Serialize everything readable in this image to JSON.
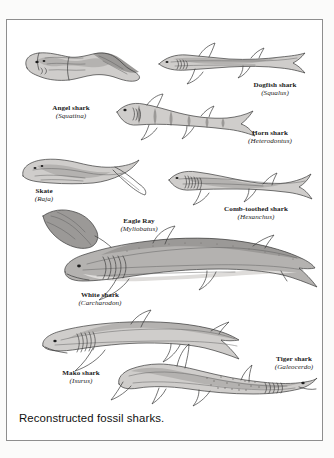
{
  "figure": {
    "caption": "Reconstructed fossil sharks.",
    "specimens": [
      {
        "id": "angel-shark",
        "common_name": "Angel shark",
        "genus": "(Squatina)"
      },
      {
        "id": "dogfish-shark",
        "common_name": "Dogfish shark",
        "genus": "(Squalus)"
      },
      {
        "id": "horn-shark",
        "common_name": "Horn shark",
        "genus": "(Heterodontus)"
      },
      {
        "id": "skate",
        "common_name": "Skate",
        "genus": "(Raja)"
      },
      {
        "id": "eagle-ray",
        "common_name": "Eagle Ray",
        "genus": "(Myliobatus)"
      },
      {
        "id": "comb-toothed-shark",
        "common_name": "Comb-toothed shark",
        "genus": "(Hexanchus)"
      },
      {
        "id": "white-shark",
        "common_name": "White shark",
        "genus": "(Carcharodon)"
      },
      {
        "id": "mako-shark",
        "common_name": "Mako shark",
        "genus": "(Isurus)"
      },
      {
        "id": "tiger-shark",
        "common_name": "Tiger shark",
        "genus": "(Galeocerdo)"
      }
    ],
    "colors": {
      "page_background": "#fbfbfa",
      "plate_background": "#ffffff",
      "frame_border": "#8e8e8e",
      "ink_outline": "#3a3a3a",
      "wash_mid": "#b4b2b0",
      "wash_light": "#cfcdcb",
      "wash_dark": "#9b9997",
      "caption_text": "#101010",
      "label_text": "#1b1b1b"
    }
  }
}
